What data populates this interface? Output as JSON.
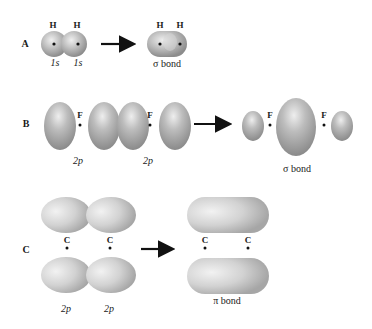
{
  "figure": {
    "rows": [
      {
        "label": "A",
        "reactants": {
          "atoms": [
            "H",
            "H"
          ],
          "orbitals": [
            "1s",
            "1s"
          ]
        },
        "product": {
          "atoms": [
            "H",
            "H"
          ],
          "caption": "σ bond"
        }
      },
      {
        "label": "B",
        "reactants": {
          "atoms": [
            "F",
            "F"
          ],
          "orbitals": [
            "2p",
            "2p"
          ]
        },
        "product": {
          "atoms": [
            "F",
            "F"
          ],
          "caption": "σ bond"
        }
      },
      {
        "label": "C",
        "reactants": {
          "atoms": [
            "C",
            "C"
          ],
          "orbitals": [
            "2p",
            "2p"
          ]
        },
        "product": {
          "atoms": [
            "C",
            "C"
          ],
          "caption": "π bond"
        }
      }
    ],
    "colors": {
      "orbital_fill": "#b8b8b8",
      "orbital_highlight": "#e8e8e8",
      "orbital_shadow": "#8a8a8a",
      "arrow": "#111111",
      "nucleus": "#111111"
    }
  }
}
